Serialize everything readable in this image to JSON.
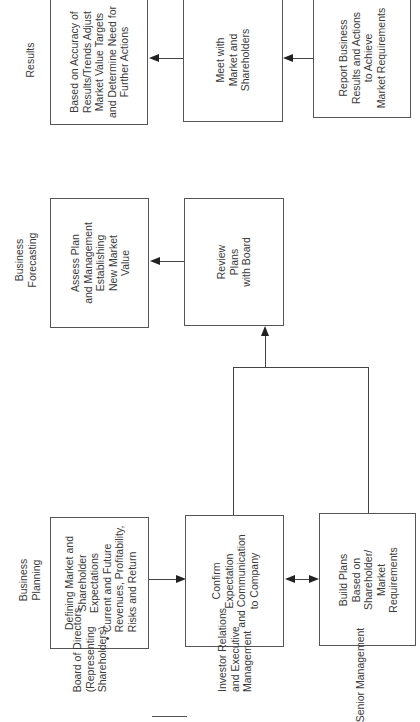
{
  "columns": {
    "results": "Results",
    "forecasting": [
      "Business",
      "Forecasting"
    ],
    "planning": [
      "Business",
      "Planning"
    ]
  },
  "roles": {
    "board": [
      "Board of Directors",
      "(Representing",
      "Shareholders)"
    ],
    "investor": [
      "Investor Relations",
      "and Executive",
      "Management"
    ],
    "senior": "Senior Management"
  },
  "boxes": {
    "results_board": [
      "Based on Accuracy of",
      "Results/Trends Adjust",
      "Market Value Targets",
      "and Determine Need for",
      "Further Actions"
    ],
    "meet": [
      "Meet with",
      "Market and",
      "Shareholders"
    ],
    "report": [
      "Report Business",
      "Results and Actions",
      "to Achieve",
      "Market Requirements"
    ],
    "assess": [
      "Assess Plan",
      "and Management",
      "Establishing",
      "New Market",
      "Value"
    ],
    "review": [
      "Review",
      "Plans",
      "with Board"
    ],
    "defining": {
      "heading": [
        "Defining Market and",
        "Shareholder",
        "Expectations"
      ],
      "bullet": [
        "Current and Future",
        "Revenues, Profitability,",
        "Risks and Return"
      ]
    },
    "confirm": [
      "Confirm",
      "Expectation",
      "and Communication",
      "to Company"
    ],
    "build": [
      "Build Plans",
      "Based on",
      "Shareholder/",
      "Market",
      "Requirements"
    ]
  }
}
